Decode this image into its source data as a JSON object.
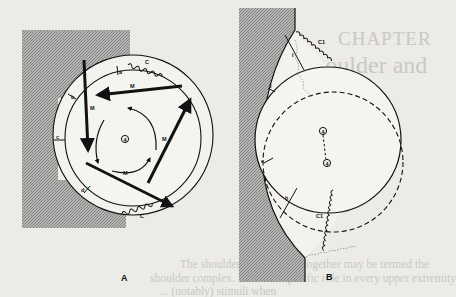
{
  "figure": {
    "panels": [
      {
        "id": "A",
        "label": "A",
        "center_label": "4",
        "arc_labels": [
          "a",
          "b",
          "c",
          "d"
        ],
        "muscle_labels": [
          "M",
          "M",
          "M",
          "M"
        ],
        "capsule_labels": [
          "C",
          "C"
        ]
      },
      {
        "id": "B",
        "label": "B",
        "center_labels": [
          "4",
          "4"
        ],
        "arc_labels": [
          "I",
          "e",
          "h"
        ],
        "capsule_labels": [
          "C1",
          "C1"
        ]
      }
    ]
  },
  "bleed_through": {
    "chapter": "CHAPTER",
    "title": "Shoulder and",
    "lines": [
      "The shoulder ... joints that together may be termed the",
      "shoulder complex. Each ... a specific role in every upper extremity",
      "... (notably) stimuli when"
    ]
  },
  "colors": {
    "paper": "#ecebe8",
    "ink": "#111111",
    "hatch_fill": "#9a9a9a",
    "bleed_text": "#c9c8c4"
  }
}
